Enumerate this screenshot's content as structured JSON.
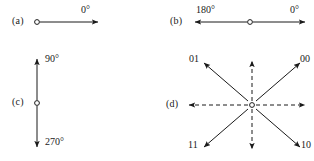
{
  "figure": {
    "width": 314,
    "height": 161,
    "background_color": "#ffffff",
    "ink_color": "#1a1a1a"
  },
  "panels": [
    {
      "id": "a",
      "label": "(a)",
      "label_x": 12,
      "label_y": 17,
      "description": "single unidirectional arrow pointing right from an open circle",
      "origin": {
        "x": 37,
        "y": 22
      },
      "arrows": [
        {
          "name": "arrow-0deg",
          "style": "solid",
          "angle_deg": 0,
          "x1": 40,
          "y1": 22,
          "x2": 98,
          "y2": 22
        }
      ],
      "labels": [
        {
          "name": "angle-label-0",
          "text": "0°",
          "x": 81,
          "y": 5
        }
      ]
    },
    {
      "id": "b",
      "label": "(b)",
      "label_x": 170,
      "label_y": 17,
      "description": "bidirectional horizontal arrow through an open circle",
      "origin": {
        "x": 250,
        "y": 22
      },
      "arrows": [
        {
          "name": "arrow-0deg",
          "style": "solid",
          "angle_deg": 0,
          "x1": 253,
          "y1": 22,
          "x2": 305,
          "y2": 22
        },
        {
          "name": "arrow-180deg",
          "style": "solid",
          "angle_deg": 180,
          "x1": 247,
          "y1": 22,
          "x2": 195,
          "y2": 22
        }
      ],
      "labels": [
        {
          "name": "angle-label-180",
          "text": "180°",
          "x": 197,
          "y": 5
        },
        {
          "name": "angle-label-0",
          "text": "0°",
          "x": 290,
          "y": 5
        }
      ]
    },
    {
      "id": "c",
      "label": "(c)",
      "label_x": 12,
      "label_y": 97,
      "description": "bidirectional vertical arrow through an open circle",
      "origin": {
        "x": 37,
        "y": 103
      },
      "arrows": [
        {
          "name": "arrow-90deg",
          "style": "solid",
          "angle_deg": 90,
          "x1": 37,
          "y1": 100,
          "x2": 37,
          "y2": 59
        },
        {
          "name": "arrow-270deg",
          "style": "solid",
          "angle_deg": 270,
          "x1": 37,
          "y1": 106,
          "x2": 37,
          "y2": 147
        }
      ],
      "labels": [
        {
          "name": "angle-label-90",
          "text": "90°",
          "x": 45,
          "y": 54
        },
        {
          "name": "angle-label-270",
          "text": "270°",
          "x": 45,
          "y": 137
        }
      ]
    },
    {
      "id": "d",
      "label": "(d)",
      "label_x": 166,
      "label_y": 99,
      "description": "eight-way star: four solid diagonal arrows labelled with two-bit codes and four dashed cardinal arrows",
      "origin": {
        "x": 252,
        "y": 105
      },
      "arrows": [
        {
          "name": "arrow-00",
          "style": "solid",
          "angle_deg": 45,
          "x1": 256,
          "y1": 101,
          "x2": 300,
          "y2": 63
        },
        {
          "name": "arrow-01",
          "style": "solid",
          "angle_deg": 135,
          "x1": 248,
          "y1": 101,
          "x2": 204,
          "y2": 63
        },
        {
          "name": "arrow-11",
          "style": "solid",
          "angle_deg": 225,
          "x1": 248,
          "y1": 109,
          "x2": 204,
          "y2": 147
        },
        {
          "name": "arrow-10",
          "style": "solid",
          "angle_deg": 315,
          "x1": 256,
          "y1": 109,
          "x2": 300,
          "y2": 147
        },
        {
          "name": "arrow-up-dashed",
          "style": "dashed",
          "angle_deg": 90,
          "x1": 252,
          "y1": 101,
          "x2": 252,
          "y2": 61
        },
        {
          "name": "arrow-down-dashed",
          "style": "dashed",
          "angle_deg": 270,
          "x1": 252,
          "y1": 109,
          "x2": 252,
          "y2": 149
        },
        {
          "name": "arrow-right-dashed",
          "style": "dashed",
          "angle_deg": 0,
          "x1": 256,
          "y1": 105,
          "x2": 305,
          "y2": 105
        },
        {
          "name": "arrow-left-dashed",
          "style": "dashed",
          "angle_deg": 180,
          "x1": 248,
          "y1": 105,
          "x2": 189,
          "y2": 105
        }
      ],
      "labels": [
        {
          "name": "code-label-01",
          "text": "01",
          "x": 189,
          "y": 54
        },
        {
          "name": "code-label-00",
          "text": "00",
          "x": 300,
          "y": 54
        },
        {
          "name": "code-label-11",
          "text": "11",
          "x": 188,
          "y": 140
        },
        {
          "name": "code-label-10",
          "text": "10",
          "x": 301,
          "y": 140
        }
      ]
    }
  ]
}
